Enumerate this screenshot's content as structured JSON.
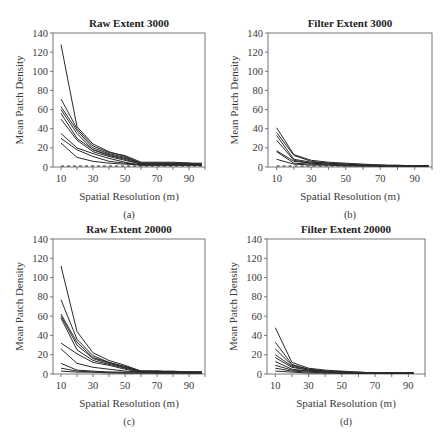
{
  "figure": {
    "panels": [
      "a",
      "b",
      "c",
      "d"
    ]
  },
  "chart_data": [
    {
      "id": "a",
      "type": "line",
      "title": "Raw Extent 3000",
      "caption": "(a)",
      "xlabel": "Spatial Resolution (m)",
      "ylabel": "Mean Patch Density",
      "xlim": [
        5,
        100
      ],
      "ylim": [
        0,
        140
      ],
      "xticks": [
        10,
        30,
        50,
        70,
        90
      ],
      "yticks": [
        0,
        20,
        40,
        60,
        80,
        100,
        120,
        140
      ],
      "grid": false,
      "legend": "none",
      "x": [
        10,
        20,
        30,
        40,
        50,
        60,
        70,
        80,
        90,
        98
      ],
      "series": [
        {
          "name": "s1",
          "values": [
            128,
            42,
            24,
            16,
            11,
            4,
            4,
            4,
            4,
            3
          ]
        },
        {
          "name": "s2",
          "values": [
            71,
            40,
            22,
            15,
            12,
            5,
            5,
            5,
            4,
            4
          ]
        },
        {
          "name": "s3",
          "values": [
            63,
            38,
            20,
            14,
            10,
            4,
            4,
            4,
            4,
            3
          ]
        },
        {
          "name": "s4",
          "values": [
            60,
            35,
            18,
            13,
            9,
            4,
            4,
            3,
            3,
            3
          ]
        },
        {
          "name": "s5",
          "values": [
            56,
            30,
            18,
            12,
            8,
            3,
            3,
            3,
            3,
            3
          ]
        },
        {
          "name": "s6",
          "values": [
            50,
            28,
            16,
            11,
            7,
            3,
            3,
            3,
            3,
            2
          ]
        },
        {
          "name": "s7",
          "values": [
            35,
            20,
            14,
            9,
            5,
            2,
            2,
            2,
            2,
            2
          ]
        },
        {
          "name": "s8",
          "values": [
            30,
            18,
            11,
            6,
            4,
            2,
            2,
            2,
            2,
            2
          ]
        },
        {
          "name": "s9",
          "values": [
            25,
            10,
            6,
            4,
            3,
            2,
            2,
            2,
            2,
            2
          ]
        },
        {
          "name": "s10",
          "values": [
            1,
            1,
            1,
            1,
            1,
            1,
            1,
            1,
            1,
            1
          ],
          "dashed": true
        }
      ]
    },
    {
      "id": "b",
      "type": "line",
      "title": "Filter Extent 3000",
      "caption": "(b)",
      "xlabel": "Spatial Resolution (m)",
      "ylabel": "Mean Patch Density",
      "xlim": [
        5,
        100
      ],
      "ylim": [
        0,
        140
      ],
      "xticks": [
        10,
        30,
        50,
        70,
        90
      ],
      "yticks": [
        0,
        20,
        40,
        60,
        80,
        100,
        120,
        140
      ],
      "grid": false,
      "legend": "none",
      "x": [
        10,
        20,
        30,
        40,
        50,
        60,
        70,
        80,
        90,
        98
      ],
      "series": [
        {
          "name": "s1",
          "values": [
            41,
            13,
            7,
            5,
            4,
            3,
            2,
            2,
            1,
            1
          ]
        },
        {
          "name": "s2",
          "values": [
            36,
            12,
            6,
            4,
            3,
            2,
            2,
            1,
            1,
            1
          ]
        },
        {
          "name": "s3",
          "values": [
            33,
            8,
            5,
            4,
            3,
            2,
            2,
            1,
            1,
            1
          ]
        },
        {
          "name": "s4",
          "values": [
            28,
            7,
            4,
            3,
            2,
            2,
            1,
            1,
            1,
            1
          ]
        },
        {
          "name": "s5",
          "values": [
            17,
            6,
            4,
            3,
            2,
            2,
            1,
            1,
            1,
            1
          ]
        },
        {
          "name": "s6",
          "values": [
            16,
            4,
            3,
            2,
            2,
            1,
            1,
            1,
            1,
            1
          ]
        },
        {
          "name": "s7",
          "values": [
            8,
            3,
            2,
            2,
            1,
            1,
            1,
            1,
            1,
            1
          ]
        },
        {
          "name": "s8",
          "values": [
            1,
            1,
            1,
            1,
            1,
            1,
            1,
            1,
            1,
            1
          ],
          "dashed": true
        }
      ]
    },
    {
      "id": "c",
      "type": "line",
      "title": "Raw Extent 20000",
      "caption": "(c)",
      "xlabel": "Spatial Resolution (m)",
      "ylabel": "Mean Patch Density",
      "xlim": [
        5,
        100
      ],
      "ylim": [
        0,
        140
      ],
      "xticks": [
        10,
        30,
        50,
        70,
        90
      ],
      "yticks": [
        0,
        20,
        40,
        60,
        80,
        100,
        120,
        140
      ],
      "grid": false,
      "legend": "none",
      "x": [
        10,
        20,
        30,
        40,
        50,
        60,
        70,
        80,
        90,
        98
      ],
      "series": [
        {
          "name": "s1",
          "values": [
            112,
            44,
            22,
            14,
            9,
            3,
            3,
            3,
            2,
            2
          ]
        },
        {
          "name": "s2",
          "values": [
            77,
            36,
            19,
            12,
            8,
            3,
            3,
            2,
            2,
            2
          ]
        },
        {
          "name": "s3",
          "values": [
            62,
            33,
            17,
            12,
            7,
            3,
            3,
            2,
            2,
            2
          ]
        },
        {
          "name": "s4",
          "values": [
            60,
            30,
            16,
            11,
            7,
            3,
            2,
            2,
            2,
            2
          ]
        },
        {
          "name": "s5",
          "values": [
            58,
            25,
            14,
            10,
            6,
            2,
            2,
            2,
            2,
            2
          ]
        },
        {
          "name": "s6",
          "values": [
            32,
            21,
            12,
            9,
            5,
            2,
            2,
            2,
            2,
            1
          ]
        },
        {
          "name": "s7",
          "values": [
            26,
            11,
            7,
            5,
            3,
            2,
            2,
            2,
            1,
            1
          ]
        },
        {
          "name": "s8",
          "values": [
            11,
            4,
            3,
            2,
            2,
            2,
            1,
            1,
            1,
            1
          ]
        },
        {
          "name": "s9",
          "values": [
            6,
            3,
            2,
            2,
            1,
            1,
            1,
            1,
            1,
            1
          ]
        },
        {
          "name": "s10",
          "values": [
            3,
            2,
            2,
            1,
            1,
            1,
            1,
            1,
            1,
            1
          ]
        }
      ]
    },
    {
      "id": "d",
      "type": "line",
      "title": "Filter Extent 20000",
      "caption": "(d)",
      "xlabel": "Spatial Resolution (m)",
      "ylabel": "Mean Patch Density",
      "xlim": [
        5,
        100
      ],
      "ylim": [
        0,
        140
      ],
      "xticks": [
        10,
        30,
        50,
        70,
        90
      ],
      "yticks": [
        0,
        20,
        40,
        60,
        80,
        100,
        120,
        140
      ],
      "grid": false,
      "legend": "none",
      "x": [
        10,
        20,
        30,
        40,
        50,
        60,
        70,
        80,
        90,
        93
      ],
      "series": [
        {
          "name": "s1",
          "values": [
            48,
            12,
            6,
            4,
            3,
            2,
            1,
            1,
            1,
            1
          ]
        },
        {
          "name": "s2",
          "values": [
            33,
            10,
            5,
            3,
            2,
            2,
            1,
            1,
            1,
            1
          ]
        },
        {
          "name": "s3",
          "values": [
            26,
            9,
            5,
            3,
            2,
            1,
            1,
            1,
            1,
            1
          ]
        },
        {
          "name": "s4",
          "values": [
            20,
            8,
            4,
            3,
            2,
            1,
            1,
            1,
            1,
            1
          ]
        },
        {
          "name": "s5",
          "values": [
            17,
            7,
            4,
            2,
            2,
            1,
            1,
            1,
            1,
            1
          ]
        },
        {
          "name": "s6",
          "values": [
            13,
            5,
            3,
            2,
            1,
            1,
            1,
            1,
            1,
            1
          ]
        },
        {
          "name": "s7",
          "values": [
            9,
            4,
            3,
            2,
            1,
            1,
            1,
            1,
            1,
            1
          ]
        },
        {
          "name": "s8",
          "values": [
            6,
            3,
            2,
            1,
            1,
            1,
            1,
            1,
            1,
            1
          ]
        },
        {
          "name": "s9",
          "values": [
            3,
            2,
            1,
            1,
            1,
            1,
            1,
            1,
            1,
            1
          ]
        }
      ]
    }
  ],
  "layout": {
    "panels": [
      {
        "id": "a",
        "left": 53,
        "top": 33,
        "right": 205,
        "bottom": 167
      },
      {
        "id": "b",
        "left": 268,
        "top": 33,
        "right": 432,
        "bottom": 167
      },
      {
        "id": "c",
        "left": 53,
        "top": 239,
        "right": 205,
        "bottom": 374
      },
      {
        "id": "d",
        "left": 267,
        "top": 239,
        "right": 425,
        "bottom": 374
      }
    ],
    "colors": {
      "line": "#2a2a2a",
      "axis": "#555555"
    }
  }
}
